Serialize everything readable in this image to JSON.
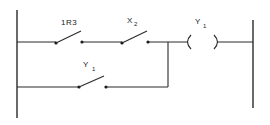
{
  "diagram": {
    "type": "ladder-logic",
    "rails": {
      "left": "L1",
      "right": "L2"
    },
    "rungs": [
      {
        "index": 0,
        "elements": [
          {
            "type": "contact-normally-open",
            "label": "1R3",
            "label_main": "1R3"
          },
          {
            "type": "contact-normally-open",
            "label": "X2",
            "label_main": "X",
            "label_sub": "2"
          },
          {
            "type": "coil",
            "label": "Y1",
            "label_main": "Y",
            "label_sub": "1"
          }
        ]
      },
      {
        "index": 1,
        "parallel_with": "rung0.contacts",
        "elements": [
          {
            "type": "contact-normally-open",
            "label": "Y1",
            "label_main": "Y",
            "label_sub": "1"
          }
        ]
      }
    ]
  },
  "colors": {
    "ink": "#2a2a2a",
    "background": "#ffffff"
  }
}
